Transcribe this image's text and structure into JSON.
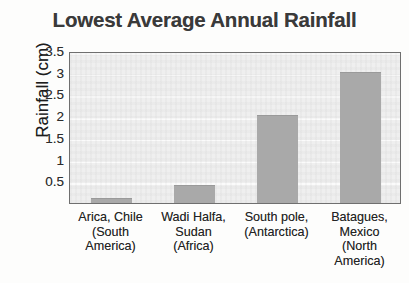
{
  "chart_data": {
    "type": "bar",
    "title": "Lowest Average Annual Rainfall",
    "xlabel": "",
    "ylabel": "Rainfall (cm)",
    "categories": [
      "Arica, Chile (South America)",
      "Wadi Halfa, Sudan (Africa)",
      "South pole, (Antarctica)",
      "Batagues, Mexico (North America)"
    ],
    "category_lines": [
      [
        "Arica, Chile",
        "(South",
        "America)"
      ],
      [
        "Wadi Halfa,",
        "Sudan",
        "(Africa)"
      ],
      [
        "South pole,",
        "(Antarctica)"
      ],
      [
        "Batagues,",
        "Mexico",
        "(North",
        "America)"
      ]
    ],
    "values": [
      0.1,
      0.4,
      2.0,
      3.0
    ],
    "ylim": [
      0,
      3.5
    ],
    "yticks": [
      3.5,
      3,
      2.5,
      2,
      1.5,
      1,
      0.5
    ],
    "ytick_labels": [
      "3.5",
      "3",
      "2.5",
      "2",
      "1.5",
      "1",
      "0.5"
    ],
    "grid": true,
    "legend": false,
    "bar_color": "#a9a9a9",
    "plot_background": "#efefef",
    "gridline_color": "#fbfbfb",
    "axis_border_color": "#6f6f6f",
    "title_color": "#3a3a3a"
  }
}
